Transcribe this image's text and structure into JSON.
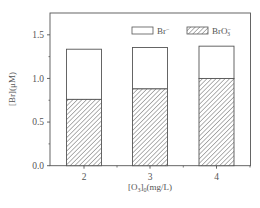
{
  "chart_data": {
    "type": "bar",
    "stacked": true,
    "title": "",
    "xlabel": "[O3]0(mg/L)",
    "ylabel": "[Br](μM)",
    "categories": [
      "2",
      "3",
      "4"
    ],
    "series": [
      {
        "name": "BrO3-",
        "pattern": "hatched",
        "values": [
          0.76,
          0.88,
          1.0
        ]
      },
      {
        "name": "Br-",
        "pattern": "empty",
        "values": [
          0.575,
          0.475,
          0.37
        ]
      }
    ],
    "totals": [
      1.335,
      1.355,
      1.37
    ],
    "ylim": [
      0,
      1.75
    ],
    "yticks": [
      "0.0",
      "0.5",
      "1.0",
      "1.5"
    ],
    "xticks": [
      "2",
      "3",
      "4"
    ],
    "grid": false,
    "legend_position": "top-right"
  },
  "legend": {
    "items": [
      {
        "label": "Br",
        "sup": "−",
        "sub": ""
      },
      {
        "label": "BrO",
        "sup": "−",
        "sub": "3"
      }
    ]
  },
  "axes": {
    "ylabel_main": "[Br](μM)",
    "xlabel_pre": "[O",
    "xlabel_sub1": "3",
    "xlabel_mid": "]",
    "xlabel_sub2": "0",
    "xlabel_post": "(mg/L)"
  },
  "colors": {
    "axis": "#555555",
    "bar_edge": "#555555",
    "hatch": "#666666",
    "background": "#ffffff"
  }
}
